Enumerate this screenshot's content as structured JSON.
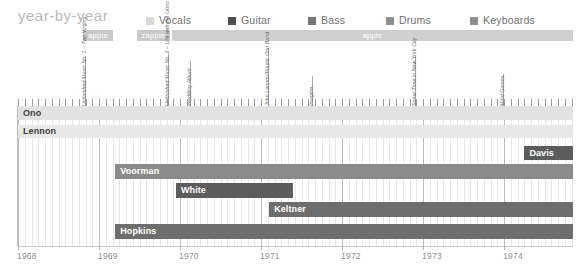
{
  "header": {
    "title": "year-by-year",
    "legend": [
      {
        "label": "Vocals",
        "color": "#d9d9d9",
        "x": 146
      },
      {
        "label": "Guitar",
        "color": "#4f4f4f",
        "x": 228
      },
      {
        "label": "Bass",
        "color": "#777777",
        "x": 308
      },
      {
        "label": "Drums",
        "color": "#8f8f8f",
        "x": 386
      },
      {
        "label": "Keyboards",
        "color": "#8f8f8f",
        "x": 470
      }
    ]
  },
  "label_bands": [
    {
      "name": "apple",
      "x": 83,
      "width": 30,
      "color": "#c9c9c9"
    },
    {
      "name": "zapple",
      "x": 137,
      "width": 33,
      "color": "#c9c9c9"
    },
    {
      "name": "apple",
      "x": 172,
      "width": 401,
      "color": "#cfcfcf"
    }
  ],
  "releases": [
    {
      "title": "Unfinished Music No. 1 – Two Virgins",
      "x": 85,
      "height": 50
    },
    {
      "title": "Unfinished Music No. 2 – Life with the Lions",
      "x": 168,
      "height": 52
    },
    {
      "title": "Wedding Album",
      "x": 190,
      "height": 45
    },
    {
      "title": "John Lennon/Plastic Ono Band",
      "x": 268,
      "height": 58
    },
    {
      "title": "Imagine",
      "x": 312,
      "height": 30
    },
    {
      "title": "Some Time in New York City",
      "x": 415,
      "height": 50
    },
    {
      "title": "Mind Games",
      "x": 503,
      "height": 32
    }
  ],
  "chart_data": {
    "type": "bar",
    "title": "year-by-year",
    "xlabel": "",
    "ylabel": "",
    "xlim": [
      1968.0,
      1974.85
    ],
    "grid": true,
    "legend_position": "top",
    "axis_ticks": [
      {
        "label": "1968",
        "value": 1968
      },
      {
        "label": "1969",
        "value": 1969
      },
      {
        "label": "1970",
        "value": 1970
      },
      {
        "label": "1971",
        "value": 1971
      },
      {
        "label": "1972",
        "value": 1972
      },
      {
        "label": "1973",
        "value": 1973
      },
      {
        "label": "1974",
        "value": 1974
      }
    ],
    "categories": [
      "Ono",
      "Lennon",
      "Davis",
      "Voorman",
      "White",
      "Keltner",
      "Hopkins"
    ],
    "series": [
      {
        "name": "Ono",
        "role": "Vocals",
        "color": "#e2e2e2",
        "text_color": "#3b3b3b",
        "start": 1968.0,
        "end": 1974.85,
        "row_top": 0,
        "row_height": 14
      },
      {
        "name": "Lennon",
        "role": "Vocals",
        "color": "#e8e8e8",
        "text_color": "#3b3b3b",
        "start": 1968.0,
        "end": 1974.85,
        "row_top": 19,
        "row_height": 13
      },
      {
        "name": "Davis",
        "role": "Guitar",
        "color": "#5c5c5c",
        "text_color": "#ffffff",
        "start": 1974.25,
        "end": 1974.85,
        "row_top": 40,
        "row_height": 14
      },
      {
        "name": "Voorman",
        "role": "Bass",
        "color": "#8a8a8a",
        "text_color": "#ffffff",
        "start": 1969.2,
        "end": 1974.85,
        "row_top": 58,
        "row_height": 15
      },
      {
        "name": "White",
        "role": "Drums",
        "color": "#5c5c5c",
        "text_color": "#ffffff",
        "start": 1969.95,
        "end": 1971.4,
        "row_top": 77,
        "row_height": 15
      },
      {
        "name": "Keltner",
        "role": "Drums",
        "color": "#6e6e6e",
        "text_color": "#ffffff",
        "start": 1971.1,
        "end": 1974.85,
        "row_top": 96,
        "row_height": 15
      },
      {
        "name": "Hopkins",
        "role": "Keyboards",
        "color": "#6e6e6e",
        "text_color": "#ffffff",
        "start": 1969.2,
        "end": 1974.85,
        "row_top": 118,
        "row_height": 15
      }
    ]
  }
}
